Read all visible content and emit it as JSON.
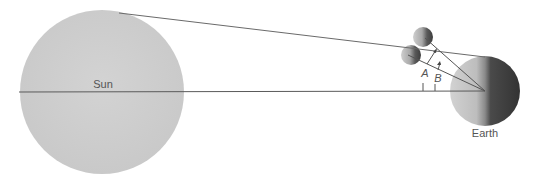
{
  "diagram": {
    "title": "",
    "bodies": {
      "sun": {
        "label": "Sun",
        "cx": 102,
        "cy": 92,
        "r": 82,
        "color": "#cfcfcf"
      },
      "earth": {
        "label": "Earth",
        "cx": 485,
        "cy": 91,
        "r": 35,
        "light_color": "#c8c8c8",
        "dark_color": "#3a3a3a"
      },
      "moon_upper": {
        "cx": 423,
        "cy": 37,
        "r": 10
      },
      "moon_lower": {
        "cx": 411,
        "cy": 55,
        "r": 10
      }
    },
    "angle_labels": {
      "a": "A",
      "b": "B"
    },
    "line_color": "#555555"
  }
}
